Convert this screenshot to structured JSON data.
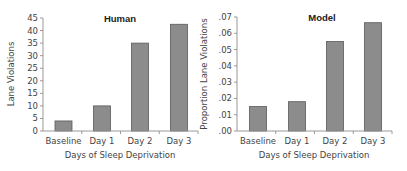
{
  "chart_data": [
    {
      "type": "bar",
      "title": "Human",
      "xlabel": "Days of Sleep Deprivation",
      "ylabel": "Lane Violations",
      "categories": [
        "Baseline",
        "Day 1",
        "Day 2",
        "Day 3"
      ],
      "values": [
        4,
        10,
        35,
        42.5
      ],
      "ylim": [
        0,
        45
      ],
      "yticks": [
        "0",
        "5",
        "10",
        "15",
        "20",
        "25",
        "30",
        "35",
        "40",
        "45"
      ],
      "grid": false,
      "legend": null,
      "bar_color": "#8c8c8c"
    },
    {
      "type": "bar",
      "title": "Model",
      "xlabel": "Days of Sleep Deprivation",
      "ylabel": "Proportion Lane Violations",
      "categories": [
        "Baseline",
        "Day 1",
        "Day 2",
        "Day 3"
      ],
      "values": [
        0.015,
        0.018,
        0.055,
        0.0665
      ],
      "ylim": [
        0,
        0.07
      ],
      "yticks": [
        ".00",
        ".01",
        ".02",
        ".03",
        ".04",
        ".05",
        ".06",
        ".07"
      ],
      "grid": false,
      "legend": null,
      "bar_color": "#8c8c8c"
    }
  ]
}
